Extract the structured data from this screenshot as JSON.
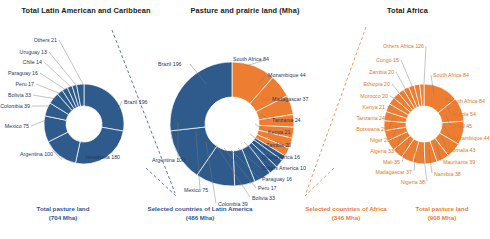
{
  "titles": {
    "left": "Total Latin American and Caribbean",
    "center": "Pasture and prairie land (Mha)",
    "right": "Total Africa"
  },
  "colors": {
    "blue": "#2E5B8C",
    "orange": "#ED7D31",
    "blue_text": "#1f3864",
    "orange_text": "#ED7D31",
    "title_text": "#1a1a1a",
    "leader": "#7b7b7b"
  },
  "captions": [
    {
      "line1": "Total pasture land",
      "line2": "(704 Mha)",
      "color": "blue"
    },
    {
      "line1": "Selected countries of Latin America",
      "line2": "(486 Mha)",
      "color": "blue"
    },
    {
      "line1": "Selected countries of Africa",
      "line2": "(346 Mha)",
      "color": "orange"
    },
    {
      "line1": "Total pasture land",
      "line2": "(908 Mha)",
      "color": "orange"
    }
  ],
  "chart_data": [
    {
      "type": "pie",
      "title": "Total Latin American and Caribbean",
      "unit": "Mha",
      "total": 704,
      "color": "#2E5B8C",
      "categories": [
        "Brazil",
        "Venezuela",
        "Argentina",
        "Mexico",
        "Colombia",
        "Bolivia",
        "Peru",
        "Paraguay",
        "Chile",
        "Uruguay",
        "Others"
      ],
      "values": [
        196,
        180,
        100,
        75,
        39,
        33,
        17,
        16,
        14,
        13,
        21
      ],
      "labels": [
        "Brazil 196",
        "Venezuela 180",
        "Argentina 100",
        "Mexico 75",
        "Colombia 39",
        "Bolivia 33",
        "Peru 17",
        "Paraguay 16",
        "Chile 14",
        "Uruguay 13",
        "Others 21"
      ]
    },
    {
      "type": "pie",
      "title": "Pasture and prairie land (Mha)",
      "unit": "Mha",
      "total": 832,
      "series": [
        {
          "name": "Latin America",
          "color": "#2E5B8C",
          "categories": [
            "Brazil",
            "Argentina",
            "Mexico",
            "Colombia",
            "Bolivia",
            "Peru",
            "Paraguay",
            "Others America"
          ],
          "values": [
            196,
            100,
            75,
            39,
            33,
            17,
            16,
            10
          ]
        },
        {
          "name": "Africa",
          "color": "#ED7D31",
          "categories": [
            "South Africa",
            "Mozambique",
            "Madagascar",
            "Tanzania",
            "Kenya",
            "Zambia",
            "Others Africa"
          ],
          "values": [
            84,
            44,
            37,
            24,
            21,
            20,
            16
          ]
        }
      ],
      "labels": [
        "Brazil 196",
        "South Africa 84",
        "Mozambique 44",
        "Madagascar 37",
        "Tanzania 24",
        "Kenya 21",
        "Zambia 20",
        "Others Africa 16",
        "Others America 10",
        "Paraguay 16",
        "Peru 17",
        "Bolivia 33",
        "Colombia 39",
        "Mexico 75",
        "Argentina 100"
      ]
    },
    {
      "type": "pie",
      "title": "Total Africa",
      "unit": "Mha",
      "total": 908,
      "color": "#ED7D31",
      "categories": [
        "Others Africa",
        "South Africa",
        "South Africa",
        "Angola",
        "Chad",
        "Mozambique",
        "Somalia",
        "Mauritania",
        "Namibia",
        "Nigeria",
        "Madagascar",
        "Mali",
        "Algeria",
        "Niger",
        "Botswana",
        "Tanzania",
        "Kenya",
        "Morocco",
        "Ethiopia",
        "Zambia",
        "Congo"
      ],
      "values": [
        126,
        84,
        84,
        54,
        45,
        44,
        43,
        43,
        38,
        38,
        37,
        35,
        33,
        29,
        26,
        24,
        21,
        20,
        20,
        20,
        15
      ],
      "labels": [
        "Others Africa 126",
        "Congo 15",
        "Zambia 20",
        "Ethiopia 20",
        "Morocco 20",
        "Kenya 21",
        "Tanzania 24",
        "Botswana 26",
        "Niger 29",
        "Algeria 33",
        "Mali 35",
        "Madagascar 37",
        "Nigeria 38",
        "Namibia 38",
        "Mauritania 39",
        "Somalia 43",
        "Mozambique 44",
        "Chad 45",
        "Angola 54",
        "South Africa 84",
        "South Africa 84"
      ]
    }
  ],
  "left_labels": [
    {
      "text": "Others 21",
      "x": 57,
      "y": 38,
      "align": "r"
    },
    {
      "text": "Uruguay 13",
      "x": 47,
      "y": 50,
      "align": "r"
    },
    {
      "text": "Chile 14",
      "x": 42,
      "y": 60,
      "align": "r"
    },
    {
      "text": "Paraguay 16",
      "x": 38,
      "y": 71,
      "align": "r"
    },
    {
      "text": "Peru 17",
      "x": 34,
      "y": 82,
      "align": "r"
    },
    {
      "text": "Bolivia 33",
      "x": 31,
      "y": 93,
      "align": "r"
    },
    {
      "text": "Colombia 39",
      "x": 30,
      "y": 104,
      "align": "r"
    },
    {
      "text": "Mexico 75",
      "x": 29,
      "y": 124,
      "align": "r"
    },
    {
      "text": "Argentina 100",
      "x": 20,
      "y": 152,
      "align": "l"
    },
    {
      "text": "Venezuela 180",
      "x": 85,
      "y": 155,
      "align": "l"
    },
    {
      "text": "Brazil 196",
      "x": 124,
      "y": 100,
      "align": "l"
    }
  ],
  "center_labels": [
    {
      "text": "Brazil 196",
      "x": 158,
      "y": 62,
      "align": "l",
      "color": "blue"
    },
    {
      "text": "South Africa 84",
      "x": 233,
      "y": 57,
      "align": "l",
      "color": "blue"
    },
    {
      "text": "Mozambique 44",
      "x": 268,
      "y": 73,
      "align": "l",
      "color": "blue"
    },
    {
      "text": "Madagascar 37",
      "x": 272,
      "y": 97,
      "align": "l",
      "color": "blue"
    },
    {
      "text": "Tanzania 24",
      "x": 272,
      "y": 118,
      "align": "l",
      "color": "blue"
    },
    {
      "text": "Kenya 21",
      "x": 268,
      "y": 130,
      "align": "l",
      "color": "blue"
    },
    {
      "text": "Zambia 20",
      "x": 266,
      "y": 143,
      "align": "l",
      "color": "blue"
    },
    {
      "text": "Others Africa 16",
      "x": 262,
      "y": 155,
      "align": "l",
      "color": "blue"
    },
    {
      "text": "Others America 10",
      "x": 262,
      "y": 166,
      "align": "l",
      "color": "blue"
    },
    {
      "text": "Paraguay 16",
      "x": 262,
      "y": 177,
      "align": "l",
      "color": "blue"
    },
    {
      "text": "Peru 17",
      "x": 258,
      "y": 186,
      "align": "l",
      "color": "blue"
    },
    {
      "text": "Bolivia 33",
      "x": 252,
      "y": 196,
      "align": "l",
      "color": "blue"
    },
    {
      "text": "Colombia 39",
      "x": 218,
      "y": 202,
      "align": "l",
      "color": "blue"
    },
    {
      "text": "Mexico 75",
      "x": 184,
      "y": 188,
      "align": "l",
      "color": "blue"
    },
    {
      "text": "Argentina 100",
      "x": 152,
      "y": 158,
      "align": "l",
      "color": "blue"
    }
  ],
  "right_labels": [
    {
      "text": "Others Africa 126",
      "x": 424,
      "y": 44,
      "align": "r"
    },
    {
      "text": "Congo 15",
      "x": 399,
      "y": 58,
      "align": "r"
    },
    {
      "text": "Zambia 20",
      "x": 394,
      "y": 70,
      "align": "r"
    },
    {
      "text": "Ethiopia 20",
      "x": 390,
      "y": 82,
      "align": "r"
    },
    {
      "text": "Morocco 20",
      "x": 388,
      "y": 94,
      "align": "r"
    },
    {
      "text": "Kenya 21",
      "x": 385,
      "y": 105,
      "align": "r"
    },
    {
      "text": "Tanzania 24",
      "x": 385,
      "y": 116,
      "align": "r"
    },
    {
      "text": "Botswana 26",
      "x": 387,
      "y": 127,
      "align": "r"
    },
    {
      "text": "Niger 29",
      "x": 390,
      "y": 138,
      "align": "r"
    },
    {
      "text": "Algeria 33",
      "x": 394,
      "y": 149,
      "align": "r"
    },
    {
      "text": "Mali 35",
      "x": 400,
      "y": 160,
      "align": "r"
    },
    {
      "text": "Madagascar 37",
      "x": 412,
      "y": 170,
      "align": "r"
    },
    {
      "text": "Nigeria 38",
      "x": 425,
      "y": 180,
      "align": "r"
    },
    {
      "text": "Namibia 38",
      "x": 434,
      "y": 172,
      "align": "l"
    },
    {
      "text": "Mauritania 39",
      "x": 443,
      "y": 160,
      "align": "l"
    },
    {
      "text": "Somalia 43",
      "x": 449,
      "y": 148,
      "align": "l"
    },
    {
      "text": "Mozambique 44",
      "x": 452,
      "y": 136,
      "align": "l"
    },
    {
      "text": "Chad 45",
      "x": 452,
      "y": 124,
      "align": "l"
    },
    {
      "text": "Angola 54",
      "x": 452,
      "y": 112,
      "align": "l"
    },
    {
      "text": "South Africa 84",
      "x": 449,
      "y": 99,
      "align": "l"
    },
    {
      "text": "South Africa 84",
      "x": 433,
      "y": 73,
      "align": "l"
    }
  ]
}
